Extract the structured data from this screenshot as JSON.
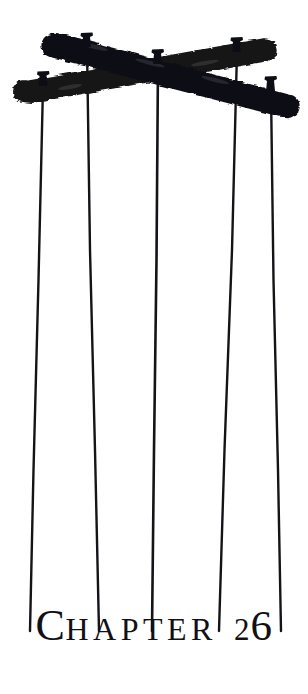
{
  "page": {
    "width": 308,
    "height": 694,
    "background_color": "#ffffff",
    "ink_color": "#111014"
  },
  "heading": {
    "full_text": "CHAPTER 26",
    "drop_cap": "C",
    "word_remainder": "HAPTER",
    "chapter_number": "26",
    "number_first_digit": "2",
    "number_second_digit": "6",
    "style": "serif-small-caps-oldstyle-figures"
  },
  "illustration": {
    "name": "crossed-beams-with-hanging-strings",
    "description": "Two crossed wooden beams forming an X with five thin strings hanging down",
    "beams": [
      {
        "name": "beam-descending",
        "from_x": 55,
        "from_y": 45,
        "to_x": 292,
        "to_y": 107,
        "thickness": 20
      },
      {
        "name": "beam-ascending",
        "from_x": 22,
        "from_y": 92,
        "to_x": 266,
        "to_y": 50,
        "thickness": 20
      }
    ],
    "pegs": [
      {
        "name": "peg-1",
        "x": 43,
        "y": 84
      },
      {
        "name": "peg-2",
        "x": 87,
        "y": 44
      },
      {
        "name": "peg-3",
        "x": 158,
        "y": 60
      },
      {
        "name": "peg-4",
        "x": 237,
        "y": 49
      },
      {
        "name": "peg-5",
        "x": 271,
        "y": 88
      }
    ],
    "strings": [
      {
        "name": "string-1",
        "top_x": 43,
        "top_y": 88,
        "bottom_x": 30,
        "bottom_y": 631
      },
      {
        "name": "string-2",
        "top_x": 87,
        "top_y": 48,
        "bottom_x": 99,
        "bottom_y": 631
      },
      {
        "name": "string-3",
        "top_x": 158,
        "top_y": 64,
        "bottom_x": 152,
        "bottom_y": 631
      },
      {
        "name": "string-4",
        "top_x": 237,
        "top_y": 53,
        "bottom_x": 219,
        "bottom_y": 631
      },
      {
        "name": "string-5",
        "top_x": 271,
        "top_y": 92,
        "bottom_x": 281,
        "bottom_y": 631
      }
    ]
  }
}
